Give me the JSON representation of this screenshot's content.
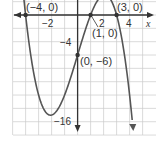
{
  "chart_data": {
    "type": "line",
    "title": "",
    "function": "y = -0.5(x + 4)(x - 1)(x - 3)",
    "xlabel": "x",
    "ylabel": "",
    "x_ticks": [
      {
        "value": -2,
        "label": "−2"
      },
      {
        "value": 2,
        "label": "2"
      },
      {
        "value": 4,
        "label": "4"
      }
    ],
    "y_ticks": [
      {
        "value": -4,
        "label": "−4"
      },
      {
        "value": -16,
        "label": "−16"
      }
    ],
    "xlim": [
      -5,
      5.5
    ],
    "ylim": [
      -18,
      2
    ],
    "grid": true,
    "grid_step_x": 1,
    "grid_step_y": 2,
    "annotations": [
      {
        "label": "(−4, 0)",
        "x": -4,
        "y": 0
      },
      {
        "label": "(1, 0)",
        "x": 1,
        "y": 0
      },
      {
        "label": "(3, 0)",
        "x": 3,
        "y": 0
      },
      {
        "label": "(0, −6)",
        "x": 0,
        "y": -6
      }
    ],
    "series": [
      {
        "name": "f(x)",
        "points": [
          [
            -4.4,
            3.7
          ],
          [
            -4,
            0
          ],
          [
            -3,
            -12
          ],
          [
            -2,
            -15
          ],
          [
            -1,
            -12
          ],
          [
            0,
            -6
          ],
          [
            1,
            0
          ],
          [
            2,
            3
          ],
          [
            3,
            0
          ],
          [
            4,
            -8
          ],
          [
            4.25,
            -11.4
          ]
        ]
      }
    ],
    "colors": {
      "curve": "#555555",
      "axis": "#333333",
      "grid": "#cccccc",
      "point": "#333333"
    }
  }
}
